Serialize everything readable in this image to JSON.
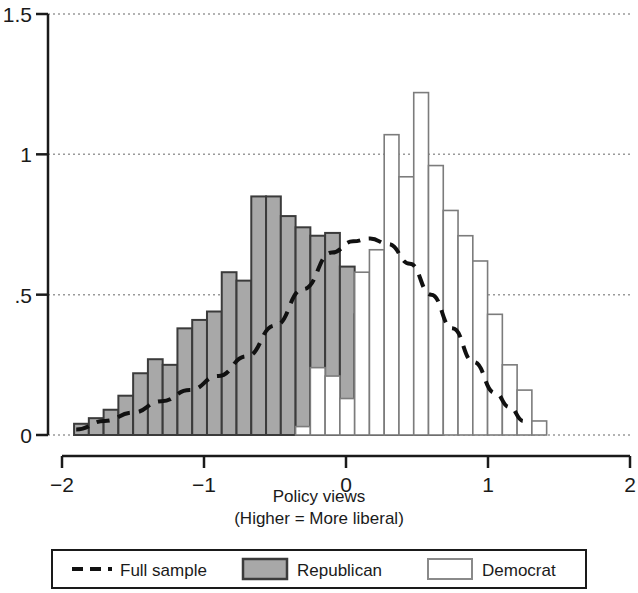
{
  "chart_data": {
    "type": "bar",
    "title": "",
    "xlabel": "Policy views",
    "xlabel_sub": "(Higher = More liberal)",
    "ylabel": "",
    "xlim": [
      -2,
      2
    ],
    "ylim": [
      0,
      1.5
    ],
    "xticks": [
      -2,
      -1,
      0,
      1,
      2
    ],
    "xtick_labels": [
      "−2",
      "−1",
      "0",
      "1",
      "2"
    ],
    "yticks": [
      0,
      0.5,
      1,
      1.5
    ],
    "ytick_labels": [
      "0",
      ".5",
      "1",
      "1.5"
    ],
    "grid": "horizontal-dotted",
    "legend_position": "below",
    "bin_width": 0.104,
    "bin_starts": [
      -1.915,
      -1.811,
      -1.707,
      -1.603,
      -1.499,
      -1.395,
      -1.291,
      -1.187,
      -1.083,
      -0.979,
      -0.875,
      -0.771,
      -0.667,
      -0.563,
      -0.459,
      -0.355,
      -0.251,
      -0.147,
      -0.043,
      0.061,
      0.165,
      0.269,
      0.373,
      0.477,
      0.581,
      0.685,
      0.789,
      0.893,
      0.997,
      1.101,
      1.205
    ],
    "series": [
      {
        "name": "Republican",
        "type": "histogram",
        "fill": "#a8a8a8",
        "edge": "#3b3b3b",
        "values": [
          0.04,
          0.06,
          0.09,
          0.14,
          0.22,
          0.27,
          0.25,
          0.38,
          0.41,
          0.44,
          0.58,
          0.55,
          0.85,
          0.85,
          0.78,
          0.74,
          0.71,
          0.72,
          0.6,
          0.43,
          0.25,
          0.18,
          0.07,
          0.03,
          0.01,
          0.0,
          0.0,
          0.0,
          0.0,
          0.0,
          0.0
        ]
      },
      {
        "name": "Democrat",
        "type": "histogram",
        "fill": "#ffffff",
        "edge": "#7c7c7c",
        "values": [
          0.0,
          0.0,
          0.0,
          0.0,
          0.0,
          0.0,
          0.0,
          0.0,
          0.0,
          0.0,
          0.0,
          0.0,
          0.0,
          0.0,
          0.0,
          0.03,
          0.24,
          0.21,
          0.13,
          0.58,
          0.66,
          1.07,
          0.92,
          1.22,
          0.96,
          0.8,
          0.71,
          0.62,
          0.43,
          0.25,
          0.16,
          0.05
        ]
      }
    ],
    "curve": {
      "name": "Full sample",
      "style": "dashed",
      "color": "#111111",
      "x": [
        -1.9,
        -1.7,
        -1.5,
        -1.3,
        -1.1,
        -0.9,
        -0.7,
        -0.5,
        -0.3,
        -0.1,
        0.05,
        0.17,
        0.3,
        0.45,
        0.6,
        0.75,
        0.9,
        1.05,
        1.15,
        1.25
      ],
      "y": [
        0.02,
        0.05,
        0.08,
        0.12,
        0.16,
        0.21,
        0.28,
        0.39,
        0.52,
        0.65,
        0.69,
        0.7,
        0.68,
        0.61,
        0.5,
        0.38,
        0.26,
        0.15,
        0.1,
        0.05
      ]
    },
    "legend": [
      {
        "label": "Full sample",
        "marker": "dashed-line"
      },
      {
        "label": "Republican",
        "marker": "filled-box",
        "fill": "#a8a8a8"
      },
      {
        "label": "Democrat",
        "marker": "open-box",
        "fill": "#ffffff"
      }
    ]
  }
}
